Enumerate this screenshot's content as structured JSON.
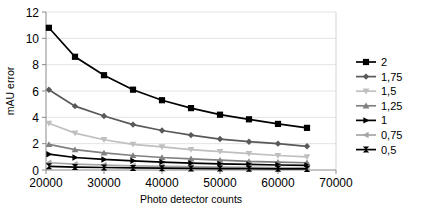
{
  "chart_data": {
    "type": "line",
    "title": "",
    "xlabel": "Photo detector counts",
    "ylabel": "mAU error",
    "xlim": [
      20000,
      70000
    ],
    "ylim": [
      0,
      12
    ],
    "xticks": [
      20000,
      30000,
      40000,
      50000,
      60000,
      70000
    ],
    "yticks": [
      0,
      2,
      4,
      6,
      8,
      10,
      12
    ],
    "grid": true,
    "legend_position": "right",
    "x": [
      20500,
      25000,
      30000,
      35000,
      40000,
      45000,
      50000,
      55000,
      60000,
      65000
    ],
    "series": [
      {
        "name": "2",
        "label": "2",
        "color": "#000000",
        "marker": "square",
        "values": [
          10.8,
          8.6,
          7.2,
          6.1,
          5.3,
          4.7,
          4.2,
          3.85,
          3.5,
          3.2
        ]
      },
      {
        "name": "1,75",
        "label": "1,75",
        "color": "#595959",
        "marker": "diamond",
        "values": [
          6.1,
          4.85,
          4.1,
          3.45,
          3.0,
          2.65,
          2.35,
          2.15,
          2.0,
          1.8
        ]
      },
      {
        "name": "1,5",
        "label": "1,5",
        "color": "#bfbfbf",
        "marker": "triangle-down",
        "values": [
          3.55,
          2.8,
          2.3,
          1.95,
          1.75,
          1.55,
          1.4,
          1.25,
          1.1,
          1.0
        ]
      },
      {
        "name": "1,25",
        "label": "1,25",
        "color": "#808080",
        "marker": "triangle-up",
        "values": [
          1.95,
          1.55,
          1.3,
          1.1,
          0.95,
          0.85,
          0.75,
          0.65,
          0.6,
          0.55
        ]
      },
      {
        "name": "1",
        "label": "1",
        "color": "#000000",
        "marker": "triangle-right",
        "values": [
          1.2,
          0.95,
          0.8,
          0.7,
          0.6,
          0.52,
          0.46,
          0.42,
          0.38,
          0.35
        ]
      },
      {
        "name": "0,75",
        "label": "0,75",
        "color": "#a6a6a6",
        "marker": "triangle-left",
        "values": [
          0.55,
          0.45,
          0.38,
          0.32,
          0.28,
          0.25,
          0.22,
          0.2,
          0.18,
          0.16
        ]
      },
      {
        "name": "0,5",
        "label": "0,5",
        "color": "#000000",
        "marker": "bowtie",
        "values": [
          0.28,
          0.22,
          0.19,
          0.16,
          0.14,
          0.12,
          0.11,
          0.1,
          0.09,
          0.08
        ]
      }
    ]
  },
  "axes": {
    "xlabel": "Photo detector counts",
    "ylabel": "mAU error",
    "xtick_labels": [
      "20000",
      "30000",
      "40000",
      "50000",
      "60000",
      "70000"
    ],
    "ytick_labels": [
      "0",
      "2",
      "4",
      "6",
      "8",
      "10",
      "12"
    ]
  },
  "legend": {
    "items": [
      {
        "label": "2"
      },
      {
        "label": "1,75"
      },
      {
        "label": "1,5"
      },
      {
        "label": "1,25"
      },
      {
        "label": "1"
      },
      {
        "label": "0,75"
      },
      {
        "label": "0,5"
      }
    ]
  }
}
